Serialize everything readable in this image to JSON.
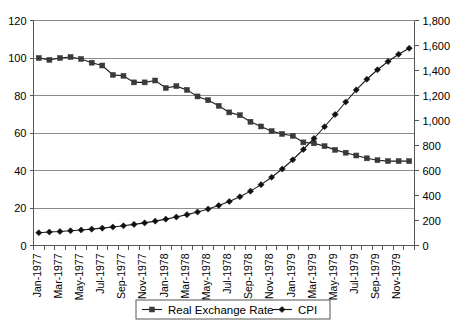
{
  "chart_data": {
    "type": "line",
    "title": "",
    "subtitle": "",
    "xlabel": "",
    "ylabel": "",
    "y2label": "",
    "grid": true,
    "legend_position": "bottom",
    "x": [
      "Jan-1977",
      "Feb-1977",
      "Mar-1977",
      "Apr-1977",
      "May-1977",
      "Jun-1977",
      "Jul-1977",
      "Aug-1977",
      "Sep-1977",
      "Oct-1977",
      "Nov-1977",
      "Dec-1977",
      "Jan-1978",
      "Feb-1978",
      "Mar-1978",
      "Apr-1978",
      "May-1978",
      "Jun-1978",
      "Jul-1978",
      "Aug-1978",
      "Sep-1978",
      "Oct-1978",
      "Nov-1978",
      "Dec-1978",
      "Jan-1979",
      "Feb-1979",
      "Mar-1979",
      "Apr-1979",
      "May-1979",
      "Jun-1979",
      "Jul-1979",
      "Aug-1979",
      "Sep-1979",
      "Oct-1979",
      "Nov-1979",
      "Dec-1979"
    ],
    "xtick_labels": [
      "Jan-1977",
      "Mar-1977",
      "May-1977",
      "Jul-1977",
      "Sep-1977",
      "Nov-1977",
      "Jan-1978",
      "Mar-1978",
      "May-1978",
      "Jul-1978",
      "Sep-1978",
      "Nov-1978",
      "Jan-1979",
      "Mar-1979",
      "May-1979",
      "Jul-1979",
      "Sep-1979",
      "Nov-1979"
    ],
    "xtick_indices": [
      0,
      2,
      4,
      6,
      8,
      10,
      12,
      14,
      16,
      18,
      20,
      22,
      24,
      26,
      28,
      30,
      32,
      34
    ],
    "ylim": [
      0,
      120
    ],
    "yticks": [
      0,
      20,
      40,
      60,
      80,
      100,
      120
    ],
    "ytick_labels": [
      "0",
      "20",
      "40",
      "60",
      "80",
      "100",
      "120"
    ],
    "y2lim": [
      0,
      1800
    ],
    "y2ticks": [
      0,
      200,
      400,
      600,
      800,
      1000,
      1200,
      1400,
      1600,
      1800
    ],
    "y2tick_labels": [
      "0",
      "200",
      "400",
      "600",
      "800",
      "1,000",
      "1,200",
      "1,400",
      "1,600",
      "1,800"
    ],
    "series": [
      {
        "name": "Real Exchange Rate",
        "axis": "left",
        "marker": "square",
        "color": "#3a3a3a",
        "values": [
          100.0,
          99.0,
          100.0,
          100.5,
          99.5,
          97.5,
          96.0,
          91.0,
          90.5,
          87.0,
          87.0,
          88.0,
          84.0,
          85.0,
          83.0,
          79.5,
          77.5,
          74.5,
          71.0,
          69.5,
          66.0,
          63.5,
          61.0,
          59.5,
          58.5,
          55.0,
          54.5,
          53.0,
          51.0,
          49.5,
          48.0,
          46.5,
          45.5,
          45.0,
          45.0,
          45.0
        ]
      },
      {
        "name": "CPI",
        "axis": "right",
        "marker": "diamond",
        "color": "#111111",
        "values": [
          102,
          108,
          112,
          118,
          124,
          131,
          139,
          148,
          158,
          169,
          181,
          195,
          211,
          228,
          247,
          268,
          292,
          320,
          352,
          390,
          435,
          487,
          546,
          612,
          686,
          768,
          856,
          950,
          1048,
          1148,
          1245,
          1330,
          1406,
          1472,
          1530,
          1578
        ]
      }
    ]
  },
  "legend": {
    "items": [
      {
        "label": "Real Exchange Rate",
        "marker": "square"
      },
      {
        "label": "CPI",
        "marker": "diamond"
      }
    ]
  }
}
